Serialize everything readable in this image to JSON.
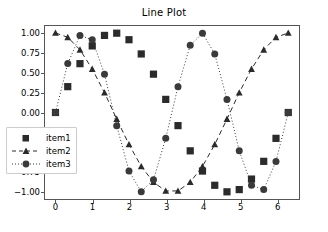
{
  "chart_data": {
    "type": "line",
    "title": "Line Plot",
    "xlabel": "",
    "ylabel": "",
    "xlim": [
      -0.31,
      6.6
    ],
    "ylim": [
      -1.1,
      1.1
    ],
    "grid": false,
    "legend_position": "lower left",
    "xticks": [
      "0",
      "1",
      "2",
      "3",
      "4",
      "5",
      "6"
    ],
    "xtick_values": [
      0,
      1,
      2,
      3,
      4,
      5,
      6
    ],
    "yticks": [
      "1.00",
      "0.75",
      "0.50",
      "0.25",
      "0.00",
      "-0.25",
      "-0.50",
      "-0.75",
      "-1.00"
    ],
    "ytick_values": [
      1.0,
      0.75,
      0.5,
      0.25,
      0.0,
      -0.25,
      -0.5,
      -0.75,
      -1.0
    ],
    "x": [
      0.0,
      0.331,
      0.661,
      0.992,
      1.323,
      1.653,
      1.984,
      2.315,
      2.645,
      2.976,
      3.307,
      3.637,
      3.968,
      4.299,
      4.629,
      4.96,
      5.291,
      5.621,
      5.952,
      6.283
    ],
    "series": [
      {
        "name": "item1",
        "marker": "square",
        "linestyle": "none",
        "color": "#2b2b2b",
        "values": [
          0.0,
          0.325,
          0.614,
          0.837,
          0.969,
          0.997,
          0.915,
          0.736,
          0.482,
          0.165,
          -0.165,
          -0.482,
          -0.736,
          -0.915,
          -0.997,
          -0.969,
          -0.837,
          -0.614,
          -0.325,
          0.0
        ]
      },
      {
        "name": "item2",
        "marker": "triangle",
        "linestyle": "dashed",
        "color": "#2b2b2b",
        "values": [
          1.0,
          0.946,
          0.789,
          0.547,
          0.249,
          -0.082,
          -0.402,
          -0.677,
          -0.876,
          -0.986,
          -0.986,
          -0.876,
          -0.677,
          -0.402,
          -0.082,
          0.249,
          0.547,
          0.789,
          0.946,
          1.0
        ]
      },
      {
        "name": "item3",
        "marker": "circle",
        "linestyle": "dotted",
        "color": "#3a3a3a",
        "values": [
          0.0,
          0.615,
          0.969,
          0.915,
          0.482,
          -0.165,
          -0.736,
          -0.997,
          -0.845,
          -0.325,
          0.325,
          0.845,
          0.997,
          0.736,
          0.165,
          -0.482,
          -0.915,
          -0.969,
          -0.615,
          0.0
        ]
      }
    ]
  },
  "legend": {
    "items": [
      {
        "label": "item1"
      },
      {
        "label": "item2"
      },
      {
        "label": "item3"
      }
    ]
  }
}
